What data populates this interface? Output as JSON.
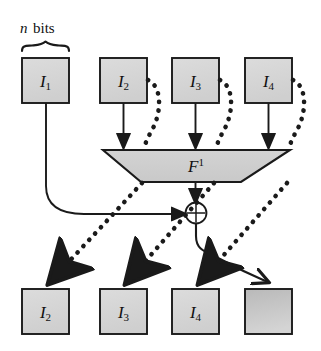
{
  "figure": {
    "caption_label": "n bits",
    "caption_italic_part": "n",
    "caption_roman_part": "bits",
    "function_label": "F",
    "function_superscript": "1",
    "colors": {
      "box_fill_light": "#d6d6d6",
      "box_fill_dark": "#bdbdbd",
      "trapezoid_fill": "#cfcfcf",
      "stroke": "#1a1a1a",
      "background": "#ffffff"
    },
    "top_row": [
      {
        "name": "I",
        "subscript": "1"
      },
      {
        "name": "I",
        "subscript": "2"
      },
      {
        "name": "I",
        "subscript": "3"
      },
      {
        "name": "I",
        "subscript": "4"
      }
    ],
    "bottom_row": [
      {
        "name": "I",
        "subscript": "2"
      },
      {
        "name": "I",
        "subscript": "3"
      },
      {
        "name": "I",
        "subscript": "4"
      },
      {
        "name": "",
        "subscript": ""
      }
    ],
    "xor_symbol": "⊕",
    "edges": {
      "solid_arrows_into_function": [
        "I2 to F1",
        "I3 to F1",
        "I4 to F1"
      ],
      "dashed_shift_arrows": [
        "I2 top to F1 left input",
        "I3 top to F1 middle input",
        "I4 top to F1 right input",
        "I2 top to I2 bottom",
        "I3 top to I3 bottom",
        "I4 top to I4 bottom"
      ],
      "solid_feedback": "I1 to XOR",
      "solid_function_output": "F1 to XOR",
      "solid_xor_output": "XOR to last bottom box"
    }
  }
}
